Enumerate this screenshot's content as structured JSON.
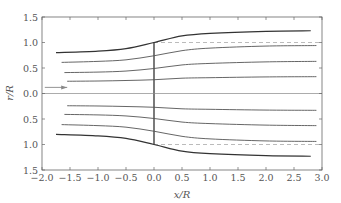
{
  "chart_data": {
    "type": "line",
    "title": "",
    "xlabel": "x/R",
    "ylabel": "r/R",
    "xlim": [
      -2.0,
      3.0
    ],
    "ylim": [
      -1.5,
      1.5
    ],
    "y_tick_labels_absolute": true,
    "xticks": [
      "−2.0",
      "−1.5",
      "−1.0",
      "−0.5",
      "0.0",
      "0.5",
      "1.0",
      "1.5",
      "2.0",
      "2.5",
      "3.0"
    ],
    "yticks": [
      "1.5",
      "1.0",
      "0.5",
      "0.0",
      "0.5",
      "1.0",
      "1.5"
    ],
    "grid": false,
    "legend": null,
    "annotations": [
      {
        "type": "vertical-line",
        "label": "actuator disc",
        "x": 0.0,
        "r_range": [
          -1.0,
          1.0
        ]
      },
      {
        "type": "dashed-line",
        "label": "disc radius reference",
        "x_range": [
          0.0,
          3.0
        ],
        "r": 1.0
      },
      {
        "type": "dashed-line",
        "label": "disc radius reference",
        "x_range": [
          0.0,
          3.0
        ],
        "r": -1.0
      },
      {
        "type": "centerline",
        "r": 0.0,
        "x_range": [
          -2.0,
          3.0
        ]
      },
      {
        "type": "arrow",
        "label": "flow direction",
        "x_from": -1.95,
        "x_to": -1.55,
        "r": 0.12
      }
    ],
    "series": [
      {
        "name": "streamline 1 (outer, boundary)",
        "x": [
          -1.75,
          -1.0,
          -0.5,
          0.0,
          0.5,
          1.0,
          2.0,
          2.8
        ],
        "r": [
          0.8,
          0.83,
          0.88,
          1.0,
          1.13,
          1.18,
          1.22,
          1.23
        ]
      },
      {
        "name": "streamline 2",
        "x": [
          -1.65,
          -1.0,
          -0.5,
          0.0,
          0.5,
          1.0,
          2.0,
          2.9
        ],
        "r": [
          0.61,
          0.63,
          0.66,
          0.74,
          0.84,
          0.89,
          0.93,
          0.94
        ]
      },
      {
        "name": "streamline 3",
        "x": [
          -1.6,
          -1.0,
          -0.5,
          0.0,
          0.5,
          1.0,
          2.0,
          2.9
        ],
        "r": [
          0.41,
          0.42,
          0.44,
          0.49,
          0.56,
          0.59,
          0.62,
          0.63
        ]
      },
      {
        "name": "streamline 4",
        "x": [
          -1.55,
          -1.0,
          -0.5,
          0.0,
          0.5,
          1.0,
          2.0,
          2.9
        ],
        "r": [
          0.24,
          0.245,
          0.255,
          0.27,
          0.3,
          0.31,
          0.325,
          0.33
        ]
      },
      {
        "name": "streamline -4",
        "x": [
          -1.55,
          -1.0,
          -0.5,
          0.0,
          0.5,
          1.0,
          2.0,
          2.9
        ],
        "r": [
          -0.24,
          -0.245,
          -0.255,
          -0.27,
          -0.3,
          -0.31,
          -0.325,
          -0.33
        ]
      },
      {
        "name": "streamline -3",
        "x": [
          -1.6,
          -1.0,
          -0.5,
          0.0,
          0.5,
          1.0,
          2.0,
          2.9
        ],
        "r": [
          -0.41,
          -0.42,
          -0.44,
          -0.49,
          -0.56,
          -0.59,
          -0.62,
          -0.63
        ]
      },
      {
        "name": "streamline -2",
        "x": [
          -1.65,
          -1.0,
          -0.5,
          0.0,
          0.5,
          1.0,
          2.0,
          2.9
        ],
        "r": [
          -0.61,
          -0.63,
          -0.66,
          -0.74,
          -0.84,
          -0.89,
          -0.93,
          -0.94
        ]
      },
      {
        "name": "streamline -1 (outer, boundary)",
        "x": [
          -1.75,
          -1.0,
          -0.5,
          0.0,
          0.5,
          1.0,
          2.0,
          2.8
        ],
        "r": [
          -0.8,
          -0.83,
          -0.88,
          -1.0,
          -1.13,
          -1.18,
          -1.22,
          -1.23
        ]
      }
    ]
  },
  "colors": {
    "axes": "#666666",
    "outer_streamline": "#333333",
    "inner_streamline": "#555555",
    "dashed": "#aaaaaa",
    "centerline": "#888888",
    "arrow": "#888888",
    "disc": "#222222"
  }
}
